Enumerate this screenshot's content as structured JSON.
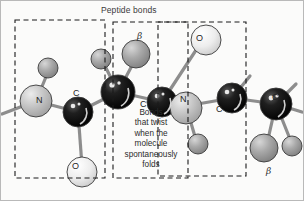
{
  "figure": {
    "title": "Peptide bonds",
    "callout_lines": [
      "Bonds",
      "that twist",
      "when the",
      "molecule",
      "spontaneously",
      "folds"
    ],
    "colors": {
      "background": "#fbfbfa",
      "carbon_alpha": "#0d0d0d",
      "carbon": "#141414",
      "nitrogen": "#b5b5b5",
      "oxygen": "#e6e6e6",
      "hydrogen": "#a8a8a8",
      "beta_carbon": "#9a9a9a",
      "bond": "#8d8d8d",
      "outline": "#3a3a3a",
      "dashed_box": "#1a1a1a",
      "text": "#2b2b2b"
    },
    "atom_labels": [
      {
        "id": "n-left",
        "text": "N",
        "x": 36,
        "y": 96
      },
      {
        "id": "c-left",
        "text": "C",
        "x": 73,
        "y": 89
      },
      {
        "id": "beta-top",
        "text": "β",
        "x": 137,
        "y": 32
      },
      {
        "id": "c-alpha-mid",
        "text": "C",
        "x": 140,
        "y": 100
      },
      {
        "id": "o-top",
        "text": "O",
        "x": 196,
        "y": 34
      },
      {
        "id": "o-bottom",
        "text": "O",
        "x": 72,
        "y": 162
      },
      {
        "id": "n-right",
        "text": "N",
        "x": 180,
        "y": 95
      },
      {
        "id": "c-right",
        "text": "C",
        "x": 216,
        "y": 105
      },
      {
        "id": "c-far-right",
        "text": "C",
        "x": 272,
        "y": 93
      },
      {
        "id": "beta-bottom",
        "text": "β",
        "x": 266,
        "y": 167
      }
    ],
    "dashed_boxes": [
      {
        "id": "box-left",
        "x": 15,
        "y": 20,
        "w": 90,
        "h": 158
      },
      {
        "id": "box-middle",
        "x": 113,
        "y": 22,
        "w": 75,
        "h": 156
      },
      {
        "id": "box-right",
        "x": 158,
        "y": 22,
        "w": 88,
        "h": 154
      }
    ]
  }
}
